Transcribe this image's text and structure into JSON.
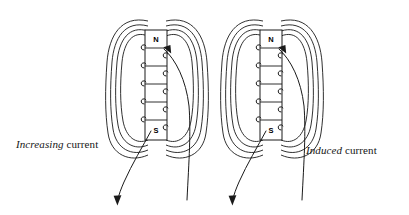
{
  "figure": {
    "background_color": "#ffffff",
    "ink_color": "#1a1a1a",
    "width": 409,
    "height": 215
  },
  "diagrams": [
    {
      "id": "left",
      "caption_emphasis": "Increasing",
      "caption_rest": " current",
      "north_pole_label": "N",
      "south_pole_label": "S",
      "coil_turns": 5,
      "field_line_loops_per_side": 4,
      "lead_arrow_direction": "down-left"
    },
    {
      "id": "right",
      "caption_emphasis": "Induced",
      "caption_rest": " current",
      "north_pole_label": "N",
      "south_pole_label": "S",
      "coil_turns": 5,
      "field_line_loops_per_side": 4,
      "lead_arrow_direction": "down-left"
    }
  ]
}
